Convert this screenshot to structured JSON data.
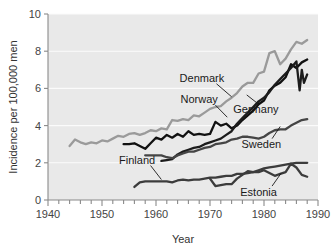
{
  "chart_data": {
    "type": "line",
    "title": "",
    "xlabel": "Year",
    "ylabel": "Incidence per 100,000 men",
    "xlim": [
      1940,
      1990
    ],
    "ylim": [
      0,
      10
    ],
    "xticks": [
      1940,
      1950,
      1960,
      1970,
      1980,
      1990
    ],
    "xtick_labels": [
      "1940",
      "1950",
      "1960",
      "1970",
      "1980",
      "1990"
    ],
    "yticks": [
      0,
      2,
      4,
      6,
      8,
      10
    ],
    "ytick_labels": [
      "0",
      "2",
      "4",
      "6",
      "8",
      "10"
    ],
    "minor_xtick_step": 2,
    "grid": "horizontal-white-on-gray",
    "legend": "inline-labels-with-leader-lines",
    "plot_background": "#e9e9e9",
    "series": [
      {
        "name": "Denmark",
        "color": "#9a9a9a",
        "width": 2.3,
        "label_x": 1968.5,
        "label_y": 6.55,
        "leader": [
          [
            1971.2,
            6.25
          ],
          [
            1974.0,
            5.55
          ]
        ],
        "x": [
          1944,
          1945,
          1946,
          1947,
          1948,
          1949,
          1950,
          1951,
          1952,
          1953,
          1954,
          1955,
          1956,
          1957,
          1958,
          1959,
          1960,
          1961,
          1962,
          1963,
          1964,
          1965,
          1966,
          1967,
          1968,
          1969,
          1970,
          1971,
          1972,
          1973,
          1974,
          1975,
          1976,
          1977,
          1978,
          1979,
          1980,
          1981,
          1982,
          1983,
          1984,
          1985,
          1986,
          1987,
          1988
        ],
        "y": [
          2.9,
          3.25,
          3.1,
          3.0,
          3.1,
          3.05,
          3.2,
          3.15,
          3.3,
          3.45,
          3.4,
          3.55,
          3.6,
          3.5,
          3.6,
          3.75,
          3.7,
          3.85,
          3.8,
          4.3,
          4.25,
          4.35,
          4.3,
          4.55,
          4.5,
          4.7,
          4.9,
          5.0,
          5.05,
          5.3,
          5.5,
          5.75,
          6.1,
          6.3,
          6.3,
          6.8,
          6.9,
          7.9,
          8.0,
          7.3,
          7.6,
          8.1,
          8.5,
          8.4,
          8.6
        ]
      },
      {
        "name": "Norway",
        "color": "#111111",
        "width": 2.3,
        "label_x": 1968.0,
        "label_y": 5.45,
        "leader": [
          [
            1971.0,
            5.1
          ],
          [
            1973.2,
            4.45
          ]
        ],
        "x": [
          1954,
          1955,
          1956,
          1957,
          1958,
          1959,
          1960,
          1961,
          1962,
          1963,
          1964,
          1965,
          1966,
          1967,
          1968,
          1969,
          1970,
          1971,
          1972,
          1973,
          1974,
          1975,
          1976,
          1977,
          1978,
          1979,
          1980,
          1981,
          1982,
          1983,
          1984,
          1985,
          1986,
          1987,
          1988
        ],
        "y": [
          3.0,
          3.0,
          3.05,
          2.9,
          2.75,
          3.05,
          3.35,
          3.25,
          3.5,
          3.35,
          3.55,
          3.4,
          3.7,
          3.5,
          3.55,
          3.5,
          3.55,
          4.2,
          4.0,
          4.1,
          3.85,
          4.0,
          4.3,
          4.55,
          4.8,
          5.15,
          5.35,
          5.9,
          6.15,
          6.3,
          6.6,
          7.3,
          7.1,
          7.4,
          7.55
        ]
      },
      {
        "name": "Germany",
        "color": "#1c1c1c",
        "width": 2.3,
        "label_x": 1978.5,
        "label_y": 4.9,
        "leader": [
          [
            1979.0,
            5.15
          ],
          [
            1976.8,
            5.65
          ]
        ],
        "x": [
          1961,
          1962,
          1963,
          1964,
          1965,
          1966,
          1967,
          1968,
          1969,
          1970,
          1971,
          1972,
          1973,
          1974,
          1975,
          1976,
          1977,
          1978,
          1979,
          1980,
          1981,
          1982,
          1983,
          1984,
          1985,
          1986,
          1986.6,
          1987,
          1987.4,
          1988
        ],
        "y": [
          2.1,
          2.15,
          2.2,
          2.45,
          2.6,
          2.7,
          2.8,
          2.85,
          3.0,
          3.1,
          3.2,
          3.3,
          3.5,
          3.7,
          4.1,
          4.4,
          4.7,
          5.0,
          5.3,
          5.5,
          5.8,
          6.2,
          6.5,
          6.8,
          7.1,
          7.45,
          5.9,
          7.0,
          6.3,
          6.75
        ]
      },
      {
        "name": "Sweden",
        "color": "#454545",
        "width": 2.3,
        "label_x": 1979.5,
        "label_y": 3.0,
        "leader": [
          [
            1981.5,
            3.3
          ],
          [
            1983.0,
            3.95
          ]
        ],
        "x": [
          1958,
          1959,
          1960,
          1961,
          1962,
          1963,
          1964,
          1965,
          1966,
          1967,
          1968,
          1969,
          1970,
          1971,
          1972,
          1973,
          1974,
          1975,
          1976,
          1977,
          1978,
          1979,
          1980,
          1981,
          1982,
          1983,
          1984,
          1985,
          1986,
          1987,
          1988
        ],
        "y": [
          2.4,
          2.4,
          2.4,
          2.4,
          2.3,
          2.25,
          2.4,
          2.5,
          2.6,
          2.6,
          2.7,
          2.8,
          2.85,
          3.0,
          3.05,
          3.1,
          3.25,
          3.3,
          3.4,
          3.4,
          3.35,
          3.3,
          3.4,
          3.6,
          3.75,
          3.8,
          3.8,
          4.0,
          4.15,
          4.3,
          4.35
        ]
      },
      {
        "name": "Finland",
        "color": "#3c3c3c",
        "width": 2.3,
        "label_x": 1956.5,
        "label_y": 2.15,
        "leader": [
          [
            1959.0,
            1.85
          ],
          [
            1961.0,
            1.1
          ]
        ],
        "x": [
          1956,
          1957,
          1958,
          1959,
          1960,
          1961,
          1962,
          1963,
          1964,
          1965,
          1966,
          1967,
          1968,
          1969,
          1970,
          1971,
          1972,
          1973,
          1974,
          1975,
          1976,
          1977,
          1978,
          1979,
          1980,
          1981,
          1982,
          1983,
          1984,
          1985,
          1986,
          1987,
          1988
        ],
        "y": [
          0.7,
          0.95,
          1.0,
          1.0,
          1.0,
          1.0,
          1.0,
          0.95,
          1.05,
          1.1,
          1.05,
          1.1,
          1.1,
          1.15,
          1.2,
          1.2,
          1.25,
          1.3,
          1.3,
          1.4,
          1.4,
          1.45,
          1.5,
          1.6,
          1.7,
          1.75,
          1.8,
          1.85,
          1.9,
          1.95,
          2.0,
          2.0,
          2.0
        ]
      },
      {
        "name": "Estonia",
        "color": "#3c3c3c",
        "width": 2.3,
        "label_x": 1979.0,
        "label_y": 0.45,
        "leader": [
          [
            1981.5,
            0.75
          ],
          [
            1983.2,
            1.45
          ]
        ],
        "x": [
          1970,
          1971,
          1972,
          1973,
          1974,
          1975,
          1976,
          1977,
          1978,
          1979,
          1980,
          1981,
          1982,
          1983,
          1984,
          1985,
          1986,
          1987,
          1988
        ],
        "y": [
          1.15,
          0.75,
          0.8,
          0.85,
          0.85,
          1.15,
          1.35,
          1.55,
          1.5,
          1.5,
          1.6,
          1.45,
          1.3,
          1.4,
          1.5,
          1.95,
          1.75,
          1.35,
          1.25
        ]
      }
    ]
  },
  "axes": {
    "y_title": "Incidence per 100,000 men",
    "x_title": "Year"
  }
}
